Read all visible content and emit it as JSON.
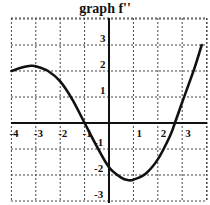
{
  "chart_data": {
    "type": "line",
    "title": "graph f''",
    "xlabel": "",
    "ylabel": "",
    "xlim": [
      -4,
      4
    ],
    "ylim": [
      -3,
      4
    ],
    "grid": true,
    "x_ticks": [
      "-4",
      "-3",
      "-2",
      "-1",
      "1",
      "2",
      "3"
    ],
    "y_ticks": [
      "3",
      "2",
      "1",
      "-1",
      "-2",
      "-3"
    ],
    "series": [
      {
        "name": "f''",
        "x": [
          -4,
          -3.5,
          -3.2,
          -3,
          -2.5,
          -2,
          -1.5,
          -1,
          -0.5,
          0,
          0.5,
          0.8,
          1,
          1.5,
          2,
          2.5,
          2.7,
          3,
          3.5,
          3.8
        ],
        "y": [
          2.0,
          2.15,
          2.2,
          2.18,
          2.0,
          1.6,
          0.9,
          0.0,
          -0.9,
          -1.7,
          -2.1,
          -2.2,
          -2.18,
          -1.95,
          -1.4,
          -0.5,
          0.0,
          0.8,
          2.1,
          3.0
        ]
      }
    ],
    "annotations": []
  }
}
